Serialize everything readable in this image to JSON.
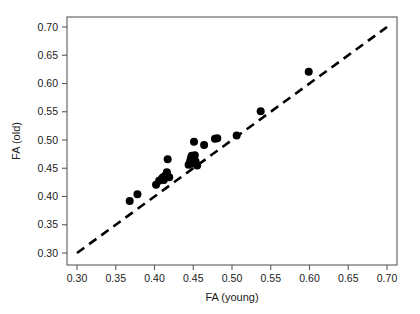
{
  "chart_data": {
    "type": "scatter",
    "title": "",
    "xlabel": "FA (young)",
    "ylabel": "FA (old)",
    "xlim": [
      0.3,
      0.7
    ],
    "ylim": [
      0.3,
      0.7
    ],
    "xticks": [
      0.3,
      0.35,
      0.4,
      0.45,
      0.5,
      0.55,
      0.6,
      0.65,
      0.7
    ],
    "yticks": [
      0.3,
      0.35,
      0.4,
      0.45,
      0.5,
      0.55,
      0.6,
      0.65,
      0.7
    ],
    "xticklabels": [
      "0.30",
      "0.35",
      "0.40",
      "0.45",
      "0.50",
      "0.55",
      "0.60",
      "0.65",
      "0.70"
    ],
    "yticklabels": [
      "0.30",
      "0.35",
      "0.40",
      "0.45",
      "0.50",
      "0.55",
      "0.60",
      "0.65",
      "0.70"
    ],
    "grid": false,
    "legend": null,
    "marker": "filled-circle",
    "marker_color": "#000000",
    "marker_size_px": 8,
    "points": [
      {
        "x": 0.368,
        "y": 0.392
      },
      {
        "x": 0.378,
        "y": 0.404
      },
      {
        "x": 0.402,
        "y": 0.421
      },
      {
        "x": 0.406,
        "y": 0.428
      },
      {
        "x": 0.409,
        "y": 0.431
      },
      {
        "x": 0.411,
        "y": 0.434
      },
      {
        "x": 0.412,
        "y": 0.429
      },
      {
        "x": 0.414,
        "y": 0.437
      },
      {
        "x": 0.416,
        "y": 0.443
      },
      {
        "x": 0.417,
        "y": 0.466
      },
      {
        "x": 0.419,
        "y": 0.434
      },
      {
        "x": 0.444,
        "y": 0.456
      },
      {
        "x": 0.446,
        "y": 0.463
      },
      {
        "x": 0.447,
        "y": 0.468
      },
      {
        "x": 0.448,
        "y": 0.472
      },
      {
        "x": 0.449,
        "y": 0.459
      },
      {
        "x": 0.45,
        "y": 0.466
      },
      {
        "x": 0.451,
        "y": 0.497
      },
      {
        "x": 0.452,
        "y": 0.473
      },
      {
        "x": 0.453,
        "y": 0.462
      },
      {
        "x": 0.455,
        "y": 0.455
      },
      {
        "x": 0.464,
        "y": 0.491
      },
      {
        "x": 0.478,
        "y": 0.502
      },
      {
        "x": 0.481,
        "y": 0.503
      },
      {
        "x": 0.506,
        "y": 0.508
      },
      {
        "x": 0.537,
        "y": 0.551
      },
      {
        "x": 0.599,
        "y": 0.621
      }
    ],
    "reference_line": {
      "kind": "identity",
      "style": "dashed",
      "from": [
        0.3,
        0.3
      ],
      "to": [
        0.7,
        0.7
      ]
    },
    "geometry": {
      "plot_left_px": 67,
      "plot_right_px": 397,
      "plot_top_px": 17,
      "plot_bottom_px": 265,
      "x_at_min_px": 77,
      "x_at_max_px": 387,
      "y_at_min_px": 253,
      "y_at_max_px": 27
    }
  }
}
